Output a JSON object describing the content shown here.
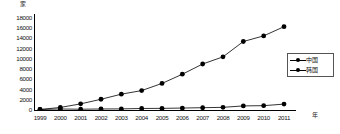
{
  "chart_data": {
    "type": "line",
    "title": "",
    "xlabel": "年",
    "ylabel": "家",
    "x": [
      1999,
      2000,
      2001,
      2002,
      2003,
      2004,
      2005,
      2006,
      2007,
      2008,
      2009,
      2010,
      2011
    ],
    "categories": [
      "1999",
      "2000",
      "2001",
      "2002",
      "2003",
      "2004",
      "2005",
      "2006",
      "2007",
      "2008",
      "2009",
      "2010",
      "2011"
    ],
    "series": [
      {
        "name": "中国",
        "values": [
          100,
          500,
          1200,
          2100,
          3100,
          3800,
          5200,
          7000,
          9000,
          10400,
          13400,
          14500,
          16300
        ],
        "color": "#000000",
        "marker": "circle"
      },
      {
        "name": "韩国",
        "values": [
          100,
          200,
          150,
          200,
          220,
          300,
          320,
          380,
          450,
          520,
          800,
          850,
          1150
        ],
        "color": "#000000",
        "marker": "circle"
      }
    ],
    "ylim": [
      0,
      18000
    ],
    "yticks": [
      0,
      2000,
      4000,
      6000,
      8000,
      10000,
      12000,
      14000,
      16000,
      18000
    ],
    "ytick_labels": [
      "0",
      "2000",
      "4000",
      "6000",
      "8000",
      "10000",
      "12000",
      "14000",
      "16000",
      "18000"
    ],
    "grid": false,
    "legend_position": "right"
  },
  "legend": {
    "items": [
      {
        "label": "中国"
      },
      {
        "label": "韩国"
      }
    ]
  },
  "axes": {
    "y_unit": "家",
    "x_unit": "年"
  }
}
